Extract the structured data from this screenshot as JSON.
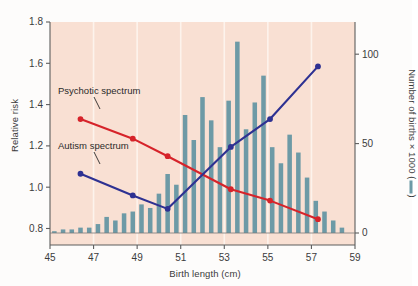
{
  "figure": {
    "background": "#f9e0d3",
    "page_background": "#fdfcfb"
  },
  "axes": {
    "left": {
      "title": "Relative risk",
      "ticks": [
        0.8,
        1.0,
        1.2,
        1.4,
        1.6,
        1.8
      ],
      "tick_labels": [
        "0.8",
        "1.0",
        "1.2",
        "1.4",
        "1.6",
        "1.8"
      ],
      "min": 0.72,
      "max": 1.8
    },
    "right": {
      "title_prefix": "Number of births × 1000 (",
      "title_suffix": ")",
      "ticks": [
        0,
        50,
        100
      ],
      "tick_labels": [
        "0",
        "50",
        "100"
      ],
      "min": 0,
      "max": 118
    },
    "bottom": {
      "title": "Birth length (cm)",
      "ticks": [
        45,
        47,
        49,
        51,
        53,
        55,
        57,
        59
      ],
      "tick_labels": [
        "45",
        "47",
        "49",
        "51",
        "53",
        "55",
        "57",
        "59"
      ],
      "min": 45,
      "max": 59
    }
  },
  "annotations": [
    {
      "name": "psychotic-spectrum-label",
      "text": "Psychotic spectrum"
    },
    {
      "name": "autism-spectrum-label",
      "text": "Autism spectrum"
    }
  ],
  "colors": {
    "psychotic": "#d6232a",
    "autism": "#2e3192",
    "bars": "#6d9aa6",
    "plot_bg": "#f9e0d3",
    "gridline": "#fdf3ec",
    "axis": "#5d5d5d",
    "text": "#3b3b3b"
  },
  "chart_data": {
    "type": "line",
    "title": "",
    "xlabel": "Birth length (cm)",
    "ylabel": "Relative risk",
    "y2label": "Number of births × 1000",
    "xlim": [
      45,
      59
    ],
    "ylim": [
      0.72,
      1.8
    ],
    "y2lim": [
      0,
      118
    ],
    "grid": "vertical-light",
    "legend": "inline-annotations",
    "series": [
      {
        "name": "Psychotic spectrum",
        "type": "line",
        "color": "#d6232a",
        "axis": "left",
        "x": [
          46.4,
          48.8,
          50.4,
          53.3,
          55.1,
          57.3
        ],
        "values": [
          1.33,
          1.235,
          1.15,
          0.99,
          0.935,
          0.845
        ]
      },
      {
        "name": "Autism spectrum",
        "type": "line",
        "color": "#2e3192",
        "axis": "left",
        "x": [
          46.4,
          48.8,
          50.4,
          53.3,
          55.1,
          57.3
        ],
        "values": [
          1.065,
          0.96,
          0.895,
          1.195,
          1.33,
          1.585
        ]
      },
      {
        "name": "Number of births",
        "type": "bar",
        "color": "#6d9aa6",
        "axis": "right",
        "x": [
          45.2,
          45.6,
          46.0,
          46.4,
          46.8,
          47.2,
          47.6,
          48.0,
          48.4,
          48.8,
          49.2,
          49.6,
          50.0,
          50.4,
          50.8,
          51.2,
          51.6,
          52.0,
          52.4,
          52.8,
          53.2,
          53.6,
          54.0,
          54.4,
          54.8,
          55.2,
          55.6,
          56.0,
          56.4,
          56.8,
          57.2,
          57.6,
          58.0,
          58.4
        ],
        "values": [
          1,
          2,
          2,
          3,
          3,
          5,
          9,
          7,
          11,
          12,
          16,
          14,
          22,
          33,
          27,
          66,
          52,
          76,
          63,
          48,
          74,
          107,
          58,
          73,
          88,
          48,
          39,
          55,
          45,
          31,
          18,
          12,
          7,
          3
        ]
      }
    ]
  }
}
